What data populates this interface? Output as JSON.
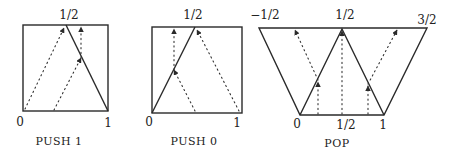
{
  "panels": [
    {
      "id": "push1",
      "caption": "PUSH 1",
      "top_labels": [
        "1/2"
      ],
      "bottom_labels": [
        "0",
        "1"
      ]
    },
    {
      "id": "push0",
      "caption": "PUSH 0",
      "top_labels": [
        "1/2"
      ],
      "bottom_labels": [
        "0",
        "1"
      ]
    },
    {
      "id": "pop",
      "caption": "POP",
      "top_labels": [
        "−1/2",
        "1/2",
        "3/2"
      ],
      "bottom_labels": [
        "0",
        "1/2",
        "1"
      ]
    }
  ]
}
